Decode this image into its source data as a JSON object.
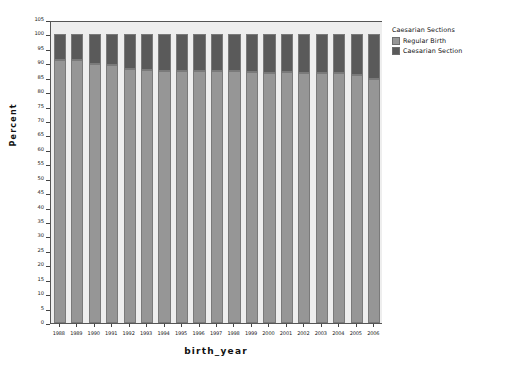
{
  "chart_data": {
    "type": "bar",
    "subtype": "stacked-100-percent",
    "title": "",
    "xlabel": "birth_year",
    "ylabel": "Percent",
    "categories": [
      "1988",
      "1989",
      "1990",
      "1991",
      "1992",
      "1993",
      "1994",
      "1995",
      "1996",
      "1997",
      "1998",
      "1999",
      "2000",
      "2001",
      "2002",
      "2003",
      "2004",
      "2005",
      "2006"
    ],
    "series": [
      {
        "name": "Regular Birth",
        "color": "#969696",
        "values": [
          91.2,
          91.0,
          89.6,
          89.4,
          88.0,
          87.6,
          87.4,
          87.4,
          87.3,
          87.2,
          87.3,
          87.1,
          86.8,
          86.9,
          86.7,
          86.6,
          86.5,
          85.8,
          84.5
        ]
      },
      {
        "name": "Caesarian Section",
        "color": "#5a5a5a",
        "values": [
          8.8,
          9.0,
          10.4,
          10.6,
          12.0,
          12.4,
          12.6,
          12.6,
          12.7,
          12.8,
          12.7,
          12.9,
          13.2,
          13.1,
          13.3,
          13.4,
          13.5,
          14.2,
          15.5
        ]
      }
    ],
    "ylim": [
      0,
      105
    ],
    "ytick_step": 5,
    "yticks": [
      0,
      5,
      10,
      15,
      20,
      25,
      30,
      35,
      40,
      45,
      50,
      55,
      60,
      65,
      70,
      75,
      80,
      85,
      90,
      95,
      100,
      105
    ],
    "grid": false,
    "legend_position": "right",
    "plot_background": "#eeeeee"
  },
  "legend": {
    "title": "Caesarian Sections",
    "entries": [
      {
        "label": "Regular Birth",
        "color": "#969696"
      },
      {
        "label": "Caesarian Section",
        "color": "#5a5a5a"
      }
    ]
  },
  "axes": {
    "x_title": "birth_year",
    "y_title": "Percent"
  }
}
